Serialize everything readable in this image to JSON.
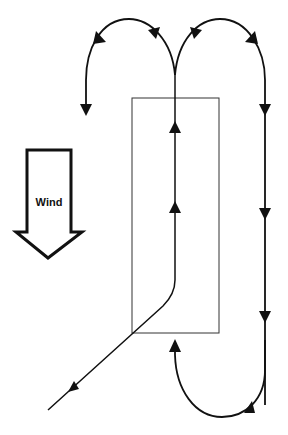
{
  "diagram": {
    "type": "flight-path / traffic-pattern diagram",
    "wind_indicator": {
      "label": "Wind",
      "direction": "down"
    },
    "elements": [
      {
        "id": "runway-box",
        "shape": "rectangle",
        "description": "Rectangular area (runway/field)"
      },
      {
        "id": "entry-path",
        "description": "Approach line entering from lower-left, bending into vertical center path"
      },
      {
        "id": "center-path",
        "description": "Vertical path up through box with two upward arrows"
      },
      {
        "id": "left-loop",
        "description": "Curved turn at top going left, ending with downward arrow"
      },
      {
        "id": "right-loop",
        "description": "Curved turn at top going right, descending straight line with downward arrows"
      },
      {
        "id": "bottom-loop",
        "description": "Curved turn at bottom returning upward into box center"
      }
    ],
    "colors": {
      "line": "#111111",
      "box": "#333333",
      "background": "#ffffff"
    }
  }
}
